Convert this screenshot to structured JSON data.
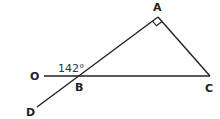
{
  "diagram": {
    "type": "geometry",
    "colors": {
      "line": "#222222",
      "text": "#222222",
      "background": "#ffffff"
    },
    "points": {
      "A": {
        "label": "A",
        "x": 158,
        "y": 17
      },
      "B": {
        "label": "B",
        "x": 79,
        "y": 76
      },
      "C": {
        "label": "C",
        "x": 210,
        "y": 76
      },
      "O": {
        "label": "O",
        "x": 44,
        "y": 76
      },
      "D": {
        "label": "D",
        "x": 37,
        "y": 107
      }
    },
    "segments": [
      {
        "from": "O",
        "to": "C"
      },
      {
        "from": "D",
        "to": "A"
      },
      {
        "from": "A",
        "to": "C"
      }
    ],
    "angles": [
      {
        "vertex": "A",
        "type": "right-angle-marker"
      },
      {
        "vertex": "B",
        "between": [
          "O",
          "A"
        ],
        "label": "142°"
      }
    ]
  }
}
